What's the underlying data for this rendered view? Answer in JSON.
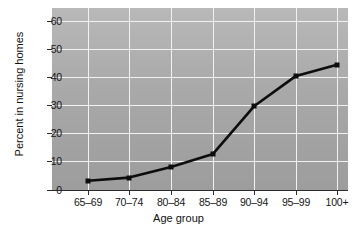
{
  "chart_data": {
    "type": "line",
    "title": "",
    "xlabel": "Age group",
    "ylabel": "Percent in nursing homes",
    "categories": [
      "65–69",
      "70–74",
      "80–84",
      "85–89",
      "90–94",
      "95–99",
      "100+"
    ],
    "values": [
      3.3,
      4.4,
      8.2,
      12.8,
      29.7,
      40.5,
      44.5
    ],
    "yticks": [
      0,
      10,
      20,
      30,
      40,
      50,
      60
    ],
    "ytick_labels": [
      "0",
      "10",
      "20",
      "30",
      "40",
      "50",
      "60"
    ],
    "ylim": [
      0,
      64
    ],
    "xlim": [
      0,
      8
    ],
    "grid": "both",
    "legend": "none",
    "series": [
      {
        "name": "Percent in nursing homes",
        "values": [
          3.3,
          4.4,
          8.2,
          12.8,
          29.7,
          40.5,
          44.5
        ],
        "line_color": "#0d0d0d",
        "marker": "square",
        "marker_color": "#0d0d0d"
      }
    ],
    "colors": {
      "plot_background": "#a9a9a9",
      "gridline": "#f2f2f2",
      "axis": "#2a2a2a",
      "text": "#161616",
      "page_background": "#ffffff"
    }
  }
}
